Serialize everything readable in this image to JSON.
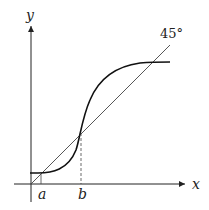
{
  "diagram": {
    "axis_x_label": "x",
    "axis_y_label": "y",
    "line_label": "45°",
    "point_a_label": "a",
    "point_b_label": "b",
    "colors": {
      "stroke": "#222222",
      "background": "#ffffff"
    }
  }
}
